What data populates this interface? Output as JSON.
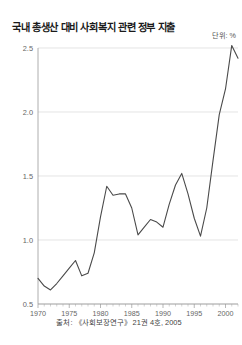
{
  "chart_data": {
    "type": "line",
    "title": "국내 총생산 대비 사회복지 관련 정부 지출",
    "subtitle": "",
    "unit_label": "단위: %",
    "source": "출처: 《사회보장연구》 21권 4호, 2005",
    "xlabel": "",
    "ylabel": "",
    "xlim": [
      1970,
      2002
    ],
    "ylim": [
      0.5,
      2.5
    ],
    "grid": true,
    "legend": "none",
    "y_ticks": [
      "0.5",
      "1.0",
      "1.5",
      "2.0",
      "2.5"
    ],
    "y_tick_values": [
      0.5,
      1.0,
      1.5,
      2.0,
      2.5
    ],
    "x_ticks": [
      "1970",
      "1975",
      "1980",
      "1985",
      "1990",
      "1995",
      "2000"
    ],
    "x_tick_values": [
      1970,
      1975,
      1980,
      1985,
      1990,
      1995,
      2000
    ],
    "x": [
      1970,
      1971,
      1972,
      1973,
      1974,
      1975,
      1976,
      1977,
      1978,
      1979,
      1980,
      1981,
      1982,
      1983,
      1984,
      1985,
      1986,
      1987,
      1988,
      1989,
      1990,
      1991,
      1992,
      1993,
      1994,
      1995,
      1996,
      1997,
      1998,
      1999,
      2000,
      2001,
      2002
    ],
    "values": [
      0.7,
      0.64,
      0.61,
      0.66,
      0.72,
      0.78,
      0.84,
      0.72,
      0.74,
      0.9,
      1.18,
      1.42,
      1.35,
      1.36,
      1.36,
      1.25,
      1.04,
      1.1,
      1.16,
      1.14,
      1.1,
      1.28,
      1.43,
      1.52,
      1.36,
      1.17,
      1.03,
      1.25,
      1.62,
      1.98,
      2.18,
      2.52,
      2.42
    ],
    "series": [
      {
        "name": "국내 총생산 대비 사회복지 관련 정부 지출",
        "color": "#4a4a4a",
        "values": [
          0.7,
          0.64,
          0.61,
          0.66,
          0.72,
          0.78,
          0.84,
          0.72,
          0.74,
          0.9,
          1.18,
          1.42,
          1.35,
          1.36,
          1.36,
          1.25,
          1.04,
          1.1,
          1.16,
          1.14,
          1.1,
          1.28,
          1.43,
          1.52,
          1.36,
          1.17,
          1.03,
          1.25,
          1.62,
          1.98,
          2.18,
          2.52,
          2.42
        ]
      }
    ],
    "colors": {
      "line": "#4a4a4a",
      "grid": "#d8d8d8",
      "axis": "#9a9a9a",
      "background": "#ffffff",
      "title": "#1a1a1a",
      "tick_text": "#666666"
    }
  }
}
